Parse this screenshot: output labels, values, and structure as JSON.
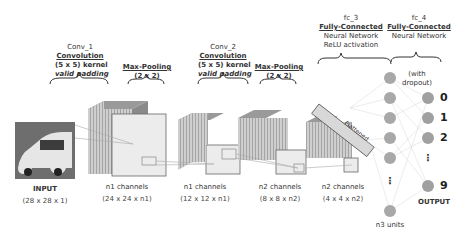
{
  "layers": [
    {
      "name": "Conv_1",
      "type": "Convolution",
      "kernel": "(5 x 5) kernel",
      "padding": "valid padding"
    },
    {
      "name": "",
      "type": "Max-Pooling",
      "kernel": "(2 x 2)"
    },
    {
      "name": "Conv_2",
      "type": "Convolution",
      "kernel": "(5 x 5) kernel",
      "padding": "valid padding"
    },
    {
      "name": "",
      "type": "Max-Pooling",
      "kernel": "(2 x 2)"
    },
    {
      "name": "fc_3",
      "type": "Fully-Connected",
      "desc1": "Neural Network",
      "desc2": "ReLU activation"
    },
    {
      "name": "fc_4",
      "type": "Fully-Connected",
      "desc1": "Neural Network",
      "note": "(with dropout)"
    }
  ],
  "stages": [
    {
      "label": "INPUT",
      "dims": "(28 x 28 x 1)"
    },
    {
      "label": "n1 channels",
      "dims": "(24 x 24 x n1)"
    },
    {
      "label": "n1 channels",
      "dims": "(12 x 12 x n1)"
    },
    {
      "label": "n2 channels",
      "dims": "(8 x 8 x n2)"
    },
    {
      "label": "n2 channels",
      "dims": "(4 x 4 x n2)"
    }
  ],
  "flatten_label": "Flattened",
  "hidden_units": "n3 units",
  "dropout_note_1": "(with",
  "dropout_note_2": "dropout)",
  "output_label": "OUTPUT",
  "outputs": [
    "0",
    "1",
    "2",
    "9"
  ],
  "ellipsis": "⋮"
}
